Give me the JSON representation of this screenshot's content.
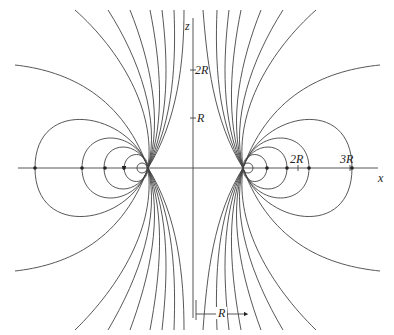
{
  "diagram": {
    "axes": {
      "x_label": "x",
      "z_label": "z"
    },
    "x_ticks": [
      "2R",
      "3R"
    ],
    "z_ticks": [
      "R",
      "2R"
    ],
    "dimension_label": "R",
    "colors": {
      "line": "#333333",
      "background": "#ffffff"
    }
  }
}
